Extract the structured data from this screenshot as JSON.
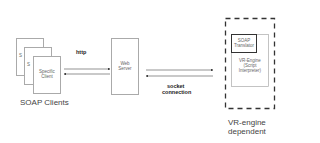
{
  "clients": {
    "page_back": "S",
    "page_middle": "S",
    "front_line1": "Specific",
    "front_line2": "Client",
    "caption": "SOAP Clients"
  },
  "edge_http": {
    "label": "http"
  },
  "web_server": {
    "line1": "Web",
    "line2": "Server"
  },
  "edge_socket": {
    "line1": "socket",
    "line2": "connection"
  },
  "engine_group": {
    "translator_line1": "SOAP",
    "translator_line2": "Translator",
    "engine_line1": "VR-Engine",
    "engine_line2": "(Script",
    "engine_line3": "Interpreter)",
    "caption_line1": "VR-engine",
    "caption_line2": "dependent"
  }
}
